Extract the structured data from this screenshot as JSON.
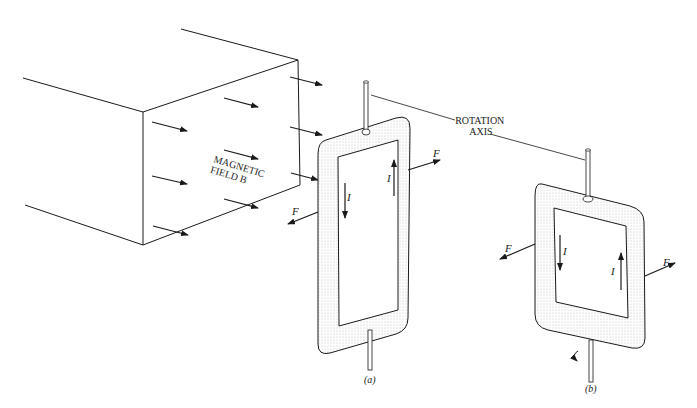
{
  "figure": {
    "magnet_label": [
      "MAGNETIC",
      "FIELD  B"
    ],
    "rotation_axis_label": [
      "ROTATION",
      "AXIS"
    ],
    "force_label": "F",
    "current_label": "I",
    "panel_a_label": "(a)",
    "panel_b_label": "(b)"
  },
  "colors": {
    "ink": "#1a1a1a",
    "stipple": "#9a9a9a",
    "background": "#ffffff"
  }
}
